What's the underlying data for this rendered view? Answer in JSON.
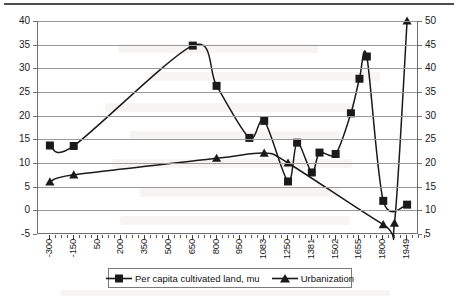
{
  "chart_data": {
    "type": "line",
    "title": "",
    "subtitle": "",
    "xlabel": "",
    "ylabel": "",
    "grid": true,
    "legend_position": "bottom",
    "categories": [
      "-300",
      "-150",
      "50",
      "200",
      "350",
      "500",
      "650",
      "800",
      "950",
      "1083",
      "1250",
      "1381",
      "1502",
      "1655",
      "1800",
      "1949"
    ],
    "xtick_labels": [
      "-300",
      "-150",
      "50",
      "200",
      "350",
      "500",
      "650",
      "800",
      "950",
      "1083",
      "1250",
      "1381",
      "1502",
      "1655",
      "1800",
      "1949"
    ],
    "axes": {
      "primary": {
        "name": "Per capita cultivated land, mu",
        "ylim": [
          -5,
          40
        ],
        "ticks": [
          40,
          35,
          30,
          25,
          20,
          15,
          10,
          5,
          0,
          -5
        ],
        "side": "left"
      },
      "secondary": {
        "name": "Urbanization",
        "ylim": [
          5,
          50
        ],
        "ticks": [
          50,
          45,
          40,
          35,
          30,
          25,
          20,
          15,
          10,
          5
        ],
        "side": "right"
      }
    },
    "series": [
      {
        "name": "Per capita cultivated land, mu",
        "axis": "primary",
        "marker": "square",
        "color": "#1a1a1a",
        "points": [
          {
            "x": -300,
            "y": 13.7
          },
          {
            "x": -150,
            "y": 13.6
          },
          {
            "x": 650,
            "y": 34.8
          },
          {
            "x": 800,
            "y": 26.3
          },
          {
            "x": 1000,
            "y": 15.3
          },
          {
            "x": 1083,
            "y": 18.9
          },
          {
            "x": 1250,
            "y": 6.1
          },
          {
            "x": 1300,
            "y": 14.3
          },
          {
            "x": 1381,
            "y": 8.0
          },
          {
            "x": 1420,
            "y": 12.2
          },
          {
            "x": 1502,
            "y": 11.9
          },
          {
            "x": 1600,
            "y": 20.5
          },
          {
            "x": 1655,
            "y": 27.8
          },
          {
            "x": 1700,
            "y": 32.5
          },
          {
            "x": 1800,
            "y": 2.0
          },
          {
            "x": 1949,
            "y": 1.2
          }
        ]
      },
      {
        "name": "Urbanization",
        "axis": "secondary",
        "marker": "triangle",
        "color": "#1a1a1a",
        "points": [
          {
            "x": -300,
            "y": 16.0
          },
          {
            "x": -150,
            "y": 17.5
          },
          {
            "x": 800,
            "y": 21.0
          },
          {
            "x": 1083,
            "y": 22.1
          },
          {
            "x": 1250,
            "y": 20.0
          },
          {
            "x": 1800,
            "y": 7.0
          },
          {
            "x": 1870,
            "y": 7.3
          },
          {
            "x": 1949,
            "y": 50.0
          }
        ]
      }
    ]
  },
  "legend": {
    "items": [
      {
        "label": "Per capita cultivated land, mu",
        "marker": "square-marker-icon"
      },
      {
        "label": "Urbanization",
        "marker": "triangle-marker-icon"
      }
    ]
  }
}
